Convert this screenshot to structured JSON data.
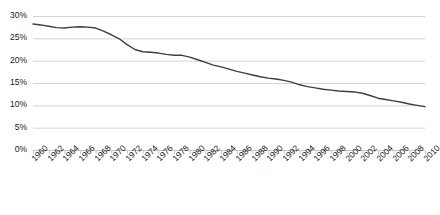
{
  "chart_data": {
    "type": "line",
    "title": "",
    "subtitle": "",
    "xlabel": "",
    "ylabel": "",
    "ylim": [
      0,
      0.3
    ],
    "xlim": [
      1960,
      2010
    ],
    "grid": true,
    "legend": null,
    "legend_position": "none",
    "y_tick_labels": [
      "0%",
      "5%",
      "10%",
      "15%",
      "20%",
      "25%",
      "30%"
    ],
    "y_tick_values": [
      0,
      5,
      10,
      15,
      20,
      25,
      30
    ],
    "x_tick_labels": [
      "1960",
      "1962",
      "1964",
      "1966",
      "1968",
      "1970",
      "1972",
      "1974",
      "1976",
      "1978",
      "1980",
      "1982",
      "1984",
      "1986",
      "1988",
      "1990",
      "1992",
      "1994",
      "1996",
      "1998",
      "2000",
      "2002",
      "2004",
      "2006",
      "2008",
      "2010"
    ],
    "x": [
      1960,
      1961,
      1962,
      1963,
      1964,
      1965,
      1966,
      1967,
      1968,
      1969,
      1970,
      1971,
      1972,
      1973,
      1974,
      1975,
      1976,
      1977,
      1978,
      1979,
      1980,
      1981,
      1982,
      1983,
      1984,
      1985,
      1986,
      1987,
      1988,
      1989,
      1990,
      1991,
      1992,
      1993,
      1994,
      1995,
      1996,
      1997,
      1998,
      1999,
      2000,
      2001,
      2002,
      2003,
      2004,
      2005,
      2006,
      2007,
      2008,
      2009,
      2010
    ],
    "values": [
      28.2,
      28.0,
      27.7,
      27.4,
      27.3,
      27.5,
      27.6,
      27.5,
      27.3,
      26.6,
      25.8,
      24.9,
      23.6,
      22.5,
      22.0,
      21.9,
      21.7,
      21.4,
      21.2,
      21.2,
      20.8,
      20.2,
      19.6,
      19.0,
      18.6,
      18.1,
      17.6,
      17.2,
      16.8,
      16.4,
      16.1,
      15.9,
      15.6,
      15.2,
      14.6,
      14.2,
      13.9,
      13.6,
      13.4,
      13.2,
      13.1,
      13.0,
      12.7,
      12.2,
      11.6,
      11.3,
      11.0,
      10.7,
      10.3,
      10.0,
      9.7
    ],
    "series": [
      {
        "name": "series-1",
        "color": "#3f3f3f",
        "line_width": 1.4,
        "markers": false
      }
    ],
    "axis_color": "#c9c9c9",
    "grid_color": "#d2d2d2",
    "background": "#ffffff",
    "value_unit": "percent"
  },
  "layout": {
    "plot_left": 33,
    "plot_right": 425,
    "plot_top": 16,
    "plot_bottom": 150
  }
}
